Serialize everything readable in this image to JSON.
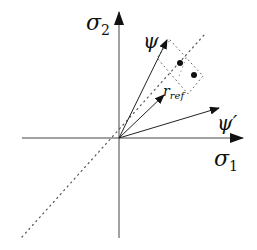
{
  "diagram": {
    "axes": {
      "x_label": "σ",
      "x_sub": "1",
      "y_label": "σ",
      "y_sub": "2"
    },
    "vectors": [
      {
        "name": "psi",
        "label": "ψ"
      },
      {
        "name": "r-ref",
        "label": "r",
        "sub": "ref"
      },
      {
        "name": "psi-prime",
        "label": "ψ′"
      }
    ],
    "points": 2,
    "diagonal": "dotted line σ1 = σ2"
  }
}
